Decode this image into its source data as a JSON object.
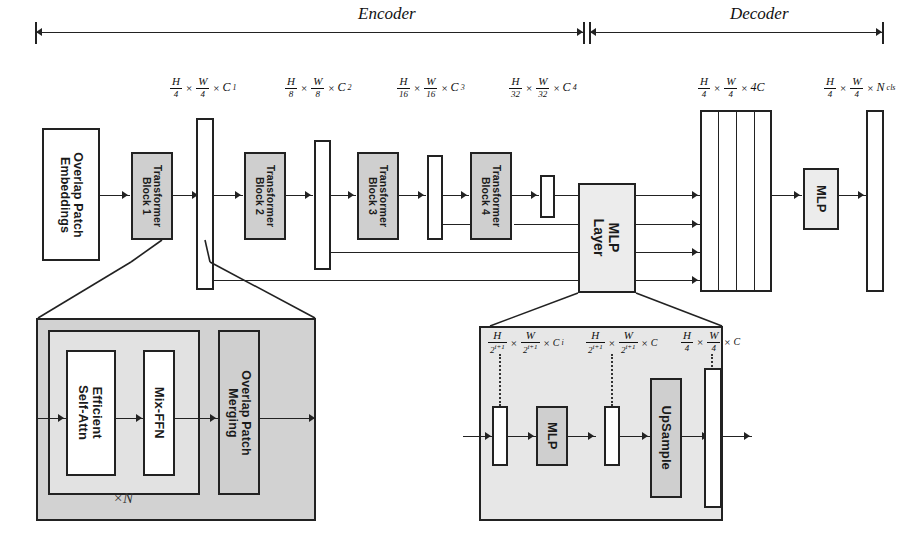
{
  "figure": {
    "sections": {
      "encoder": "Encoder",
      "decoder": "Decoder"
    }
  },
  "encoder": {
    "input_block": {
      "line1": "Overlap Patch",
      "line2": "Embeddings"
    },
    "blocks": [
      {
        "line1": "Transformer",
        "line2": "Block 1"
      },
      {
        "line1": "Transformer",
        "line2": "Block 2"
      },
      {
        "line1": "Transformer",
        "line2": "Block 3"
      },
      {
        "line1": "Transformer",
        "line2": "Block 4"
      }
    ],
    "stage_dims": [
      {
        "num1": "H",
        "den1": "4",
        "num2": "W",
        "den2": "4",
        "chan": "C",
        "sub": "1"
      },
      {
        "num1": "H",
        "den1": "8",
        "num2": "W",
        "den2": "8",
        "chan": "C",
        "sub": "2"
      },
      {
        "num1": "H",
        "den1": "16",
        "num2": "W",
        "den2": "16",
        "chan": "C",
        "sub": "3"
      },
      {
        "num1": "H",
        "den1": "32",
        "num2": "W",
        "den2": "32",
        "chan": "C",
        "sub": "4"
      }
    ]
  },
  "decoder": {
    "mlp_layer": {
      "line1": "MLP",
      "line2": "Layer"
    },
    "mlp": {
      "line1": "MLP"
    },
    "dims": [
      {
        "num1": "H",
        "den1": "4",
        "num2": "W",
        "den2": "4",
        "chan": "4C",
        "sub": ""
      },
      {
        "num1": "H",
        "den1": "4",
        "num2": "W",
        "den2": "4",
        "chan": "N",
        "sub": "cls"
      }
    ]
  },
  "block_detail": {
    "repeat_label": "×N",
    "modules": [
      {
        "line1": "Efficient",
        "line2": "Self-Attn"
      },
      {
        "line1": "Mix-FFN",
        "line2": ""
      },
      {
        "line1": "Overlap Patch",
        "line2": "Merging"
      }
    ]
  },
  "mlp_detail": {
    "modules": [
      {
        "line1": "MLP",
        "line2": ""
      },
      {
        "line1": "UpSample",
        "line2": ""
      }
    ],
    "dims": [
      {
        "num1": "H",
        "den1": "2",
        "denexp": "i+1",
        "num2": "W",
        "den2": "2",
        "den2exp": "i+1",
        "chan": "C",
        "sub": "i"
      },
      {
        "num1": "H",
        "den1": "2",
        "denexp": "i+1",
        "num2": "W",
        "den2": "2",
        "den2exp": "i+1",
        "chan": "C",
        "sub": ""
      },
      {
        "num1": "H",
        "den1": "4",
        "denexp": "",
        "num2": "W",
        "den2": "4",
        "den2exp": "",
        "chan": "C",
        "sub": ""
      }
    ]
  },
  "colors": {
    "stroke": "#222222",
    "shaded": "#cfcfcf",
    "lite": "#ececec",
    "panel": "#d2d2d2",
    "panel_inner": "#e2e2e2",
    "background": "#ffffff"
  }
}
